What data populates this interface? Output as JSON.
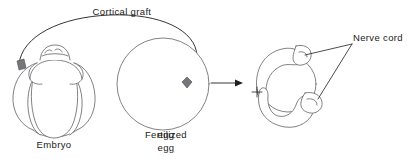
{
  "figure": {
    "background_color": "#ffffff",
    "line_color": "#58585c",
    "text_color": "#1a1a1a",
    "graft_color": "#77777b"
  },
  "labels": {
    "cortical_graft": "Cortical graft",
    "embryo": "Embryo",
    "fertilized_egg_line1": "Fertilized",
    "fertilized_egg_line2": "egg",
    "nerve_cord": "Nerve cord"
  },
  "stages": [
    {
      "name": "embryo",
      "label": "Embryo",
      "description": "Multi-lobed segmented embryo with cortical graft region on left side"
    },
    {
      "name": "fertilized-egg",
      "label": "Fertilized egg",
      "description": "Spherical fertilized egg with transplanted cortical graft inside"
    },
    {
      "name": "nerve-cord-result",
      "label": "Nerve cord",
      "description": "Resulting ring-shaped structure with two nerve cords"
    }
  ],
  "annotations": {
    "graft_transfer_arrow": "curved arrow from embryo graft to fertilized egg",
    "development_arrow": "straight arrow from fertilized egg to resulting structure",
    "nerve_cord_leaders": "two leader lines from Nerve cord label to both cords"
  }
}
